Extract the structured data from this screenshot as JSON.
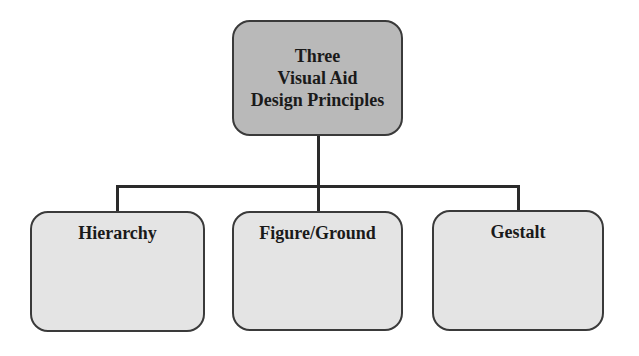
{
  "diagram": {
    "type": "hierarchy",
    "root": {
      "lines": [
        "Three",
        "Visual Aid",
        "Design Principles"
      ],
      "fill": "#b9b9b9"
    },
    "children": [
      {
        "label": "Hierarchy",
        "fill": "#e4e4e4"
      },
      {
        "label": "Figure/Ground",
        "fill": "#e4e4e4"
      },
      {
        "label": "Gestalt",
        "fill": "#e4e4e4"
      }
    ],
    "connector_color": "#2a2a2a"
  }
}
